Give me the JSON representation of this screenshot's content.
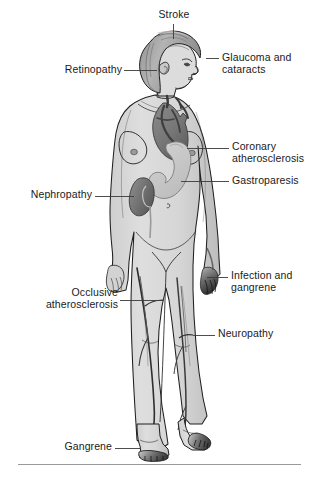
{
  "figure": {
    "background_color": "#ffffff",
    "body_fill_color": "#d9d9d9",
    "body_outline_color": "#1a1a1a",
    "organ_dark_color": "#7a7a7a",
    "organ_light_color": "#c9c9c9",
    "hair_color": "#a8a8a8",
    "leader_line_color": "#3b3b3b",
    "label_text_color": "#1a1a1a",
    "rule_color": "#9a9a9a"
  },
  "callouts": [
    {
      "id": "stroke",
      "name": "stroke",
      "line1": "Stroke",
      "line2": "",
      "align": "center",
      "text_x": 148,
      "text_y": 9,
      "text_width": 52,
      "leader": {
        "type": "vertical",
        "x1": 173,
        "y1": 24,
        "x2": 173,
        "y2": 39
      }
    },
    {
      "id": "glaucoma-cataracts",
      "name": "glaucoma-and-cataracts",
      "line1": "Glaucoma and",
      "line2": "cataracts",
      "align": "left",
      "text_x": 222,
      "text_y": 52,
      "text_width": 92,
      "leader": {
        "type": "horizontal",
        "x1": 206,
        "y1": 58,
        "x2": 219,
        "y2": 58
      }
    },
    {
      "id": "retinopathy",
      "name": "retinopathy",
      "line1": "Retinopathy",
      "line2": "",
      "align": "right",
      "text_x": 46,
      "text_y": 64,
      "text_width": 76,
      "leader": {
        "type": "horizontal",
        "x1": 124,
        "y1": 70,
        "x2": 157,
        "y2": 70
      }
    },
    {
      "id": "coronary-atherosclerosis",
      "name": "coronary-atherosclerosis",
      "line1": "Coronary",
      "line2": "atherosclerosis",
      "align": "left",
      "text_x": 232,
      "text_y": 141,
      "text_width": 82,
      "leader": {
        "type": "horizontal",
        "x1": 187,
        "y1": 148,
        "x2": 229,
        "y2": 148
      }
    },
    {
      "id": "gastroparesis",
      "name": "gastroparesis",
      "line1": "Gastroparesis",
      "line2": "",
      "align": "left",
      "text_x": 232,
      "text_y": 175,
      "text_width": 82,
      "leader": {
        "type": "horizontal",
        "x1": 181,
        "y1": 181,
        "x2": 229,
        "y2": 181
      }
    },
    {
      "id": "nephropathy",
      "name": "nephropathy",
      "line1": "Nephropathy",
      "line2": "",
      "align": "right",
      "text_x": 8,
      "text_y": 189,
      "text_width": 84,
      "leader": {
        "type": "horizontal",
        "x1": 95,
        "y1": 196,
        "x2": 134,
        "y2": 196
      }
    },
    {
      "id": "infection-gangrene",
      "name": "infection-and-gangrene",
      "line1": "Infection and",
      "line2": "gangrene",
      "align": "left",
      "text_x": 231,
      "text_y": 270,
      "text_width": 83,
      "leader": {
        "type": "horizontal",
        "x1": 207,
        "y1": 277,
        "x2": 228,
        "y2": 277
      }
    },
    {
      "id": "occlusive-atherosclerosis",
      "name": "occlusive-atherosclerosis",
      "line1": "Occlusive",
      "line2": "atherosclerosis",
      "align": "right",
      "text_x": 10,
      "text_y": 287,
      "text_width": 108,
      "leader": {
        "type": "horizontal",
        "x1": 120,
        "y1": 300,
        "x2": 163,
        "y2": 300
      }
    },
    {
      "id": "neuropathy",
      "name": "neuropathy",
      "line1": "Neuropathy",
      "line2": "",
      "align": "left",
      "text_x": 218,
      "text_y": 328,
      "text_width": 90,
      "leader": {
        "type": "horizontal",
        "x1": 193,
        "y1": 335,
        "x2": 215,
        "y2": 335
      }
    },
    {
      "id": "gangrene",
      "name": "gangrene",
      "line1": "Gangrene",
      "line2": "",
      "align": "right",
      "text_x": 46,
      "text_y": 441,
      "text_width": 66,
      "leader": {
        "type": "horizontal",
        "x1": 115,
        "y1": 448,
        "x2": 140,
        "y2": 448
      }
    }
  ],
  "anatomy_regions": [
    {
      "name": "heart",
      "shading": "dark",
      "description": "coronary arteries on heart in chest"
    },
    {
      "name": "stomach",
      "shading": "light",
      "description": "J-shaped stomach in upper abdomen"
    },
    {
      "name": "kidney",
      "shading": "dark",
      "description": "kidney at left flank"
    },
    {
      "name": "hand-gangrene",
      "shading": "dark",
      "description": "darkened fingers of right hand"
    },
    {
      "name": "foot-gangrene",
      "shading": "dark",
      "description": "darkened toes of both feet"
    }
  ]
}
